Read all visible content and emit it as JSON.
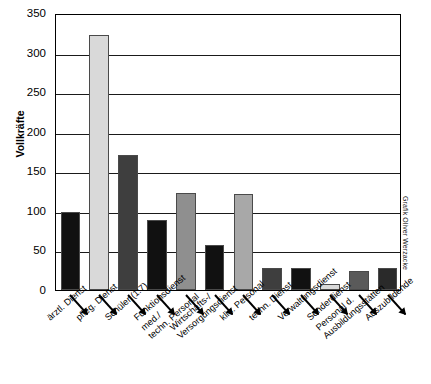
{
  "chart_data": {
    "type": "bar",
    "title": "",
    "xlabel": "",
    "ylabel": "Vollkräfte",
    "ylim": [
      0,
      350
    ],
    "ytick_step": 50,
    "yticks": [
      0,
      50,
      100,
      150,
      200,
      250,
      300,
      350
    ],
    "grid": true,
    "legend": false,
    "categories": [
      "ärztl. Dienst",
      "pfleg. Dienst",
      "Schüler (1:7)",
      "Funktionsdienst",
      "med./techn. Personal",
      "Wirtschafts-/Versorgungsdienst",
      "klin. Personal",
      "techn. Dienst",
      "Verwaltungsdienst",
      "Sonderdienst",
      "Personal d. Ausbildungsstätten",
      "Auszubildende"
    ],
    "values": [
      98,
      322,
      170,
      88,
      123,
      57,
      121,
      28,
      28,
      8,
      24,
      28
    ],
    "bar_colors": [
      "#111111",
      "#d9d9d9",
      "#3e3e3e",
      "#111111",
      "#8f8f8f",
      "#111111",
      "#a8a8a8",
      "#3e3e3e",
      "#111111",
      "#d9d9d9",
      "#5a5a5a",
      "#2a2a2a"
    ]
  },
  "axis": {
    "y_title": "Vollkräfte",
    "tick_labels": [
      "350",
      "300",
      "250",
      "200",
      "150",
      "100",
      "50",
      "0"
    ]
  },
  "credit": {
    "text": "Grafik Oliver Werzacke"
  },
  "colors": {
    "axis": "#000000",
    "grid": "#1a1a1a",
    "background": "#ffffff"
  }
}
